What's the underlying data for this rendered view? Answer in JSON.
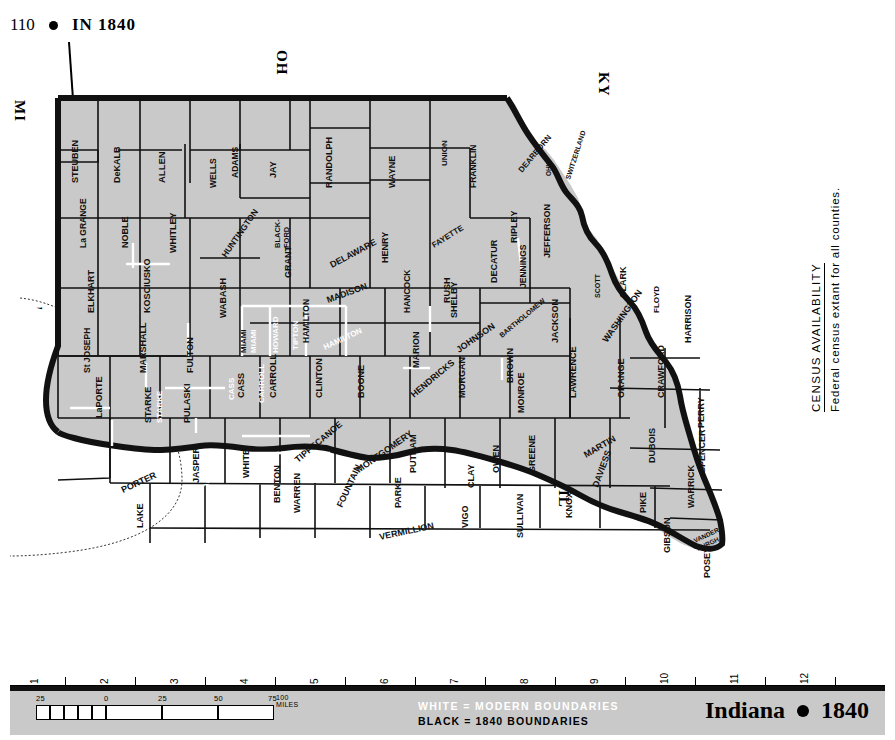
{
  "header": {
    "page_number": "110",
    "title": "IN 1840"
  },
  "neighbors": {
    "michigan": "MI",
    "ohio": "OH",
    "kentucky": "KY",
    "illinois": "IL",
    "lake": "Lake Michigan"
  },
  "census": {
    "heading": "CENSUS AVAILABILITY",
    "body": "Federal census extant for all counties."
  },
  "legend": {
    "white_line": "WHITE  =  MODERN  BOUNDARIES",
    "black_line": "BLACK  =  1840  BOUNDARIES"
  },
  "brand": {
    "state": "Indiana",
    "year": "1840"
  },
  "ruler": {
    "numbers": [
      "1",
      "2",
      "3",
      "4",
      "5",
      "6",
      "7",
      "8",
      "9",
      "10",
      "11",
      "12"
    ]
  },
  "scale": {
    "labels": [
      "25",
      "0",
      "25",
      "50",
      "75"
    ],
    "units": "100 MILES"
  },
  "counties_black_1840": [
    "STEUBEN",
    "DeKALB",
    "ALLEN",
    "WELLS",
    "ADAMS",
    "JAY",
    "RANDOLPH",
    "WAYNE",
    "UNION",
    "FRANKLIN",
    "DEARBORN",
    "OHIO",
    "SWITZERLAND",
    "La GRANGE",
    "NOBLE",
    "WHITLEY",
    "HUNTINGTON",
    "BLACK-FORD",
    "DELAWARE",
    "HENRY",
    "FAYETTE",
    "RIPLEY",
    "JEFFERSON",
    "ELKHART",
    "KOSCIUSKO",
    "WABASH",
    "GRANT",
    "MADISON",
    "HANCOCK",
    "RUSH",
    "SHELBY",
    "DECATUR",
    "JENNINGS",
    "SCOTT",
    "CLARK",
    "FLOYD",
    "St JOSEPH",
    "MARSHALL",
    "FULTON",
    "MIAMI",
    "HAMILTON",
    "MARION",
    "JOHNSON",
    "BARTHOLOMEW",
    "JACKSON",
    "WASHINGTON",
    "HARRISON",
    "LaPORTE",
    "STARKE",
    "PULASKI",
    "CASS",
    "CARROLL",
    "CLINTON",
    "BOONE",
    "HENDRICKS",
    "MORGAN",
    "BROWN",
    "MONROE",
    "LAWRENCE",
    "ORANGE",
    "CRAWFORD",
    "PERRY",
    "PORTER",
    "LAKE",
    "JASPER",
    "NEWTON",
    "WHITE",
    "BENTON",
    "WARREN",
    "TIPPECANOE",
    "MONTGOMERY",
    "PUTNAM",
    "CLAY",
    "OWEN",
    "GREENE",
    "MARTIN",
    "DAVIESS",
    "DUBOIS",
    "SPENCER",
    "WARRICK",
    "PIKE",
    "GIBSON",
    "VANDER-BURGH",
    "POSEY",
    "KNOX",
    "SULLIVAN",
    "VIGO",
    "VERMILLION",
    "PARKE",
    "FOUNTAIN"
  ],
  "counties_white_modern": [
    "MIAMI",
    "HOWARD",
    "TIPTON",
    "HAMILTON",
    "CASS",
    "CARROLL",
    "STARKE",
    "JASPER",
    "NEWTON"
  ],
  "map_colors": {
    "land": "#c9c9c9",
    "water": "#ffffff",
    "boundary_1840": "#111111",
    "boundary_modern": "#ffffff",
    "state_outline": "#000000"
  }
}
